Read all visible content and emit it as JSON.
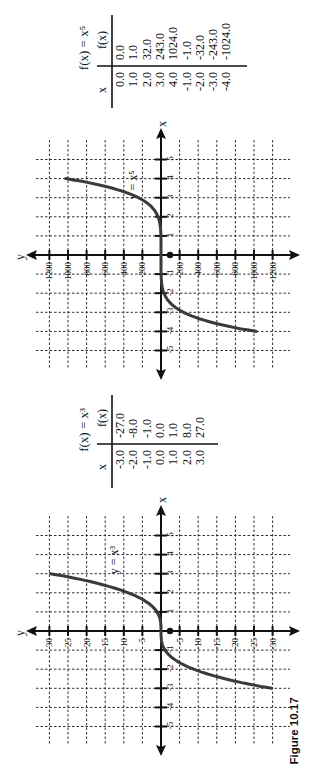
{
  "caption": "Figure 10.17",
  "colors": {
    "curve": "#3a3a3a",
    "axis": "#111111",
    "grid": "#333333",
    "background": "#ffffff"
  },
  "orientation": "rotated 90° counter-clockwise",
  "tables": [
    {
      "title": "f(x) = x⁵",
      "headers": {
        "x": "x",
        "fx": "f(x)"
      },
      "rows": [
        {
          "x": "0.0",
          "fx": "0.0"
        },
        {
          "x": "1.0",
          "fx": "1.0"
        },
        {
          "x": "2.0",
          "fx": "32.0"
        },
        {
          "x": "3.0",
          "fx": "243.0"
        },
        {
          "x": "4.0",
          "fx": "1024.0"
        },
        {
          "x": "-1.0",
          "fx": "-1.0"
        },
        {
          "x": "-2.0",
          "fx": "-32.0"
        },
        {
          "x": "-3.0",
          "fx": "-243.0"
        },
        {
          "x": "-4.0",
          "fx": "-1024.0"
        }
      ]
    },
    {
      "title": "f(x) = x³",
      "headers": {
        "x": "x",
        "fx": "f(x)"
      },
      "rows": [
        {
          "x": "-3.0",
          "fx": "-27.0"
        },
        {
          "x": "-2.0",
          "fx": "-8.0"
        },
        {
          "x": "-1.0",
          "fx": "-1.0"
        },
        {
          "x": "0.0",
          "fx": "0.0"
        },
        {
          "x": "1.0",
          "fx": "1.0"
        },
        {
          "x": "2.0",
          "fx": "8.0"
        },
        {
          "x": "3.0",
          "fx": "27.0"
        }
      ]
    }
  ],
  "charts": [
    {
      "curve_label": "y = x⁵",
      "x_axis_label": "x",
      "y_axis_label": "y",
      "origin_label": "0",
      "x_ticks": [
        "-5",
        "-4",
        "-3",
        "-2",
        "-1",
        "1",
        "2",
        "3",
        "4",
        "5"
      ],
      "y_ticks": [
        "1200",
        "1000",
        "800",
        "600",
        "400",
        "200",
        "-200",
        "-400",
        "-600",
        "-800",
        "-1000",
        "-1200"
      ]
    },
    {
      "curve_label": "y = x³",
      "x_axis_label": "x",
      "y_axis_label": "y",
      "origin_label": "0",
      "x_ticks": [
        "-5",
        "-4",
        "-3",
        "-2",
        "-1",
        "1",
        "2",
        "3",
        "4",
        "5"
      ],
      "y_ticks": [
        "30",
        "25",
        "20",
        "15",
        "10",
        "5",
        "-5",
        "-10",
        "-15",
        "-20",
        "-25",
        "-30"
      ]
    }
  ],
  "chart_data": [
    {
      "type": "line",
      "title": "y = x⁵",
      "xlabel": "x",
      "ylabel": "y",
      "x": [
        -4,
        -3,
        -2,
        -1,
        0,
        1,
        2,
        3,
        4
      ],
      "series": [
        {
          "name": "y = x⁵",
          "values": [
            -1024,
            -243,
            -32,
            -1,
            0,
            1,
            32,
            243,
            1024
          ]
        }
      ],
      "xlim": [
        -5,
        5
      ],
      "ylim": [
        -1200,
        1200
      ],
      "x_ticks": [
        -5,
        -4,
        -3,
        -2,
        -1,
        0,
        1,
        2,
        3,
        4,
        5
      ],
      "y_ticks": [
        -1200,
        -1000,
        -800,
        -600,
        -400,
        -200,
        0,
        200,
        400,
        600,
        800,
        1000,
        1200
      ],
      "grid": true,
      "legend": "none"
    },
    {
      "type": "line",
      "title": "y = x³",
      "xlabel": "x",
      "ylabel": "y",
      "x": [
        -3,
        -2,
        -1,
        0,
        1,
        2,
        3
      ],
      "series": [
        {
          "name": "y = x³",
          "values": [
            -27,
            -8,
            -1,
            0,
            1,
            8,
            27
          ]
        }
      ],
      "xlim": [
        -5,
        5
      ],
      "ylim": [
        -30,
        30
      ],
      "x_ticks": [
        -5,
        -4,
        -3,
        -2,
        -1,
        0,
        1,
        2,
        3,
        4,
        5
      ],
      "y_ticks": [
        -30,
        -25,
        -20,
        -15,
        -10,
        -5,
        0,
        5,
        10,
        15,
        20,
        25,
        30
      ],
      "grid": true,
      "legend": "none"
    }
  ]
}
